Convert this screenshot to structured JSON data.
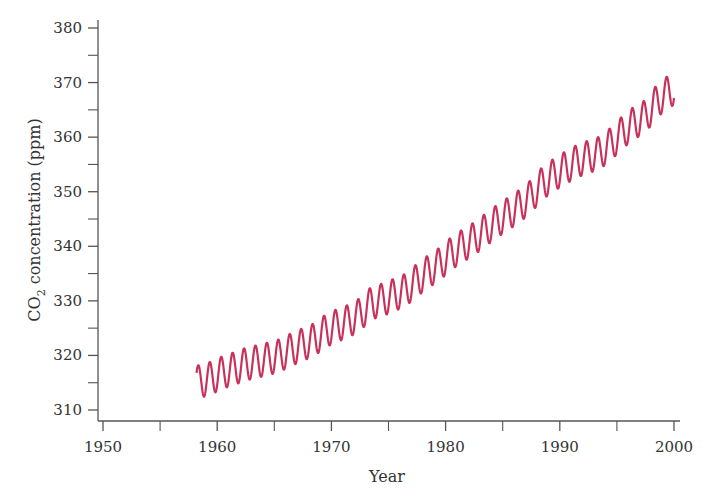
{
  "chart_data": {
    "type": "line",
    "title": "",
    "xlabel": "Year",
    "ylabel": "CO2 concentration (ppm)",
    "ylabel_parts": {
      "main": "CO",
      "subscript": "2",
      "rest": " concentration (ppm)"
    },
    "xlim": [
      1950,
      2000
    ],
    "ylim": [
      308,
      380
    ],
    "x_ticks": [
      1950,
      1960,
      1970,
      1980,
      1990,
      2000
    ],
    "x_tick_labels": [
      "1950",
      "1960",
      "1970",
      "1980",
      "1990",
      "2000"
    ],
    "x_minor_ticks": [
      1955,
      1965,
      1975,
      1985,
      1995
    ],
    "y_ticks": [
      310,
      320,
      330,
      340,
      350,
      360,
      370,
      380
    ],
    "y_tick_labels": [
      "310",
      "320",
      "330",
      "340",
      "350",
      "360",
      "370",
      "380"
    ],
    "y_minor_ticks": [
      315,
      325,
      335,
      345,
      355,
      365,
      375
    ],
    "grid": false,
    "legend": null,
    "series": [
      {
        "name": "CO2 concentration (monthly, seasonal cycle)",
        "color": "#C8325A",
        "start_year": 1958.2,
        "end_year": 2000.0,
        "seasonal_amplitude_ppm": 3.0,
        "annual_mean": {
          "x": [
            1958,
            1959,
            1960,
            1961,
            1962,
            1963,
            1964,
            1965,
            1966,
            1967,
            1968,
            1969,
            1970,
            1971,
            1972,
            1973,
            1974,
            1975,
            1976,
            1977,
            1978,
            1979,
            1980,
            1981,
            1982,
            1983,
            1984,
            1985,
            1986,
            1987,
            1988,
            1989,
            1990,
            1991,
            1992,
            1993,
            1994,
            1995,
            1996,
            1997,
            1998,
            1999,
            2000
          ],
          "y": [
            315.2,
            315.9,
            316.9,
            317.6,
            318.4,
            318.9,
            319.4,
            320.0,
            321.1,
            322.0,
            322.9,
            324.5,
            325.5,
            326.3,
            327.5,
            329.6,
            330.2,
            331.1,
            332.0,
            333.8,
            335.4,
            336.8,
            338.7,
            340.1,
            341.4,
            343.0,
            344.6,
            346.0,
            347.4,
            349.2,
            351.6,
            353.1,
            354.4,
            355.6,
            356.4,
            357.1,
            358.8,
            360.9,
            362.6,
            363.8,
            366.6,
            368.3,
            369.5
          ]
        }
      }
    ]
  },
  "colors": {
    "line": "#C8325A",
    "axis": "#555555",
    "text": "#333333"
  }
}
